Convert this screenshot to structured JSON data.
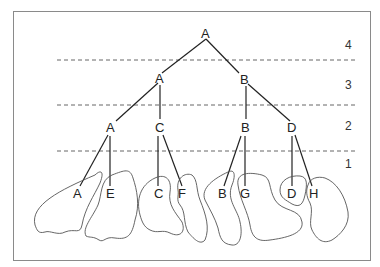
{
  "diagram": {
    "type": "hierarchical-tree-over-regions",
    "levels": [
      {
        "label": "4",
        "y": 47
      },
      {
        "label": "3",
        "y": 86
      },
      {
        "label": "2",
        "y": 126
      },
      {
        "label": "1",
        "y": 165
      }
    ],
    "nodes": {
      "root": {
        "label": "A"
      },
      "l3_left": {
        "label": "A"
      },
      "l3_right": {
        "label": "B"
      },
      "l2_a": {
        "label": "A"
      },
      "l2_c": {
        "label": "C"
      },
      "l2_b": {
        "label": "B"
      },
      "l2_d": {
        "label": "D"
      },
      "leaf_a": {
        "label": "A"
      },
      "leaf_e": {
        "label": "E"
      },
      "leaf_c": {
        "label": "C"
      },
      "leaf_f": {
        "label": "F"
      },
      "leaf_b": {
        "label": "B"
      },
      "leaf_g": {
        "label": "G"
      },
      "leaf_d": {
        "label": "D"
      },
      "leaf_h": {
        "label": "H"
      }
    },
    "line_color": "#222222",
    "divider_color": "#555555",
    "blob_color": "#555555"
  }
}
